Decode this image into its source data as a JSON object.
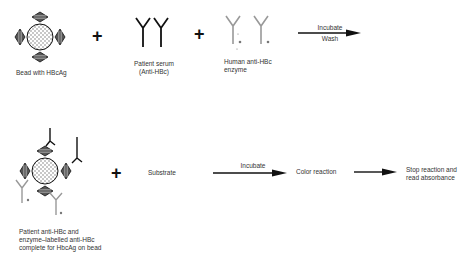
{
  "diagram": {
    "top_row": {
      "bead_label": "Bead with HBcAg",
      "plus_1": "+",
      "serum_label_line1": "Patient serum",
      "serum_label_line2": "(Anti-HBc)",
      "plus_2": "+",
      "enzyme_label_line1": "Human anti-HBc",
      "enzyme_label_line2": "enzyme",
      "arrow_label_top": "Incubate",
      "arrow_label_bottom": "Wash"
    },
    "bottom_row": {
      "complex_label_line1": "Patient anti-HBc and",
      "complex_label_line2": "enzyme–labelled anti-HBc",
      "complex_label_line3": "complete for HbcAg on bead",
      "plus": "+",
      "substrate_label": "Substrate",
      "arrow1_label": "Incubate",
      "color_reaction_label": "Color reaction",
      "final_label_line1": "Stop reaction and",
      "final_label_line2": "read absorbance"
    },
    "colors": {
      "ink": "#111111",
      "patient_antibody": "#222222",
      "enzyme_antibody": "#888888",
      "antigen_fill": "#555555",
      "bead_dots": "#666666"
    }
  }
}
